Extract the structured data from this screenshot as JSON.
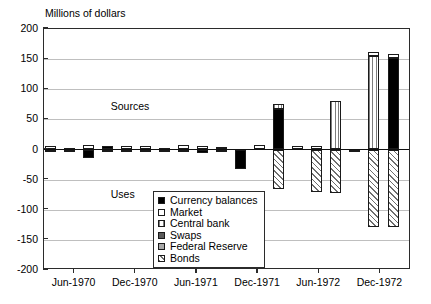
{
  "chart_data": {
    "type": "bar",
    "title": "",
    "ylabel": "Millions of dollars",
    "xlabel": "",
    "ylim": [
      -200,
      200
    ],
    "ytick_values": [
      200,
      150,
      100,
      50,
      0,
      -50,
      -100,
      -150,
      -200
    ],
    "ytick_labels": [
      "200",
      "150",
      "100",
      "50",
      "0",
      "-50",
      "-100",
      "-150",
      "-200"
    ],
    "xtick_labels": [
      "Jun-1970",
      "Dec-1970",
      "Jun-1971",
      "Dec-1971",
      "Jun-1972",
      "Dec-1972"
    ],
    "grid": true,
    "stacked": true,
    "legend_position": "inside-center-lower",
    "legend_entries": [
      {
        "label": "Currency balances",
        "swatch": "black-solid",
        "color": "#000000"
      },
      {
        "label": "Market",
        "swatch": "white-solid",
        "color": "#ffffff"
      },
      {
        "label": "Central bank",
        "swatch": "vertical-lines",
        "color": "#7d7d7d"
      },
      {
        "label": "Swaps",
        "swatch": "dark-gray-solid",
        "color": "#5a5a5a"
      },
      {
        "label": "Federal Reserve",
        "swatch": "light-gray-solid",
        "color": "#a8a8a8"
      },
      {
        "label": "Bonds",
        "swatch": "diagonal-hatch",
        "color": "#6e6e6e"
      }
    ],
    "annotations": [
      {
        "text": "Sources",
        "x_period": "Dec-1970",
        "y_value": 70
      },
      {
        "text": "Uses",
        "x_period": "Dec-1970",
        "y_value": -75
      }
    ],
    "series": [
      {
        "name": "Currency balances",
        "key": "currency"
      },
      {
        "name": "Market",
        "key": "market"
      },
      {
        "name": "Central bank",
        "key": "centralbank"
      },
      {
        "name": "Swaps",
        "key": "swaps"
      },
      {
        "name": "Federal Reserve",
        "key": "fed"
      },
      {
        "name": "Bonds",
        "key": "bonds"
      }
    ],
    "bars": [
      {
        "period": "Jun-1970",
        "segments": [
          {
            "key": "market",
            "value": 5
          },
          {
            "key": "currency",
            "value": -2
          }
        ]
      },
      {
        "period": "Aug-1970",
        "segments": [
          {
            "key": "market",
            "value": 2
          },
          {
            "key": "currency",
            "value": -1
          }
        ]
      },
      {
        "period": "Oct-1970",
        "segments": [
          {
            "key": "market",
            "value": 8
          },
          {
            "key": "currency",
            "value": -14
          }
        ]
      },
      {
        "period": "Dec-1970",
        "segments": [
          {
            "key": "currency",
            "value": 6
          },
          {
            "key": "market",
            "value": -1
          }
        ]
      },
      {
        "period": "Feb-1971",
        "segments": [
          {
            "key": "market",
            "value": 6
          },
          {
            "key": "currency",
            "value": -3
          }
        ]
      },
      {
        "period": "Apr-1971",
        "segments": [
          {
            "key": "market",
            "value": 5
          },
          {
            "key": "currency",
            "value": -2
          }
        ]
      },
      {
        "period": "Jun-1971",
        "segments": [
          {
            "key": "market",
            "value": 2
          },
          {
            "key": "currency",
            "value": -4
          }
        ]
      },
      {
        "period": "Aug-1971",
        "segments": [
          {
            "key": "market",
            "value": 7
          },
          {
            "key": "currency",
            "value": -1
          }
        ]
      },
      {
        "period": "Oct-1971",
        "segments": [
          {
            "key": "market",
            "value": 6
          },
          {
            "key": "currency",
            "value": -5
          }
        ]
      },
      {
        "period": "Nov-1971",
        "segments": [
          {
            "key": "market",
            "value": 4
          },
          {
            "key": "currency",
            "value": -2
          }
        ]
      },
      {
        "period": "Dec-1971",
        "segments": [
          {
            "key": "currency",
            "value": -32
          }
        ]
      },
      {
        "period": "Jan-1972",
        "segments": [
          {
            "key": "market",
            "value": 7
          }
        ]
      },
      {
        "period": "Feb-1972",
        "segments": [
          {
            "key": "currency",
            "value": 68
          },
          {
            "key": "centralbank",
            "value": 8
          },
          {
            "key": "bonds",
            "value": -65
          }
        ]
      },
      {
        "period": "Mar-1972",
        "segments": [
          {
            "key": "market",
            "value": 5
          }
        ]
      },
      {
        "period": "May-1972",
        "segments": [
          {
            "key": "market",
            "value": 5
          },
          {
            "key": "bonds",
            "value": -70
          }
        ]
      },
      {
        "period": "Jun-1972",
        "segments": [
          {
            "key": "centralbank",
            "value": 80
          },
          {
            "key": "bonds",
            "value": -72
          }
        ]
      },
      {
        "period": "Aug-1972",
        "segments": [
          {
            "key": "fed",
            "value": -4
          }
        ]
      },
      {
        "period": "Nov-1972",
        "segments": [
          {
            "key": "centralbank",
            "value": 155
          },
          {
            "key": "market",
            "value": 6
          },
          {
            "key": "bonds",
            "value": -128
          }
        ]
      },
      {
        "period": "Dec-1972",
        "segments": [
          {
            "key": "currency",
            "value": 152
          },
          {
            "key": "market",
            "value": 7
          },
          {
            "key": "bonds",
            "value": -128
          }
        ]
      }
    ]
  }
}
